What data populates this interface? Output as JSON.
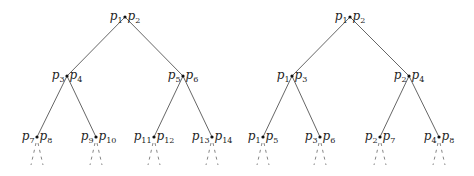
{
  "trees": [
    {
      "name": "left-tree",
      "nodes": [
        {
          "id": "root",
          "x": 125,
          "y": 17,
          "left": "1",
          "right": "2"
        },
        {
          "id": "l",
          "x": 67,
          "y": 76,
          "left": "3",
          "right": "4"
        },
        {
          "id": "r",
          "x": 183,
          "y": 76,
          "left": "5",
          "right": "6"
        },
        {
          "id": "ll",
          "x": 37,
          "y": 137,
          "left": "7",
          "right": "8"
        },
        {
          "id": "lr",
          "x": 96,
          "y": 137,
          "left": "9",
          "right": "10"
        },
        {
          "id": "rl",
          "x": 154,
          "y": 137,
          "left": "11",
          "right": "12"
        },
        {
          "id": "rr",
          "x": 212,
          "y": 137,
          "left": "13",
          "right": "14"
        }
      ]
    },
    {
      "name": "right-tree",
      "nodes": [
        {
          "id": "root",
          "x": 350,
          "y": 17,
          "left": "1",
          "right": "2"
        },
        {
          "id": "l",
          "x": 292,
          "y": 76,
          "left": "1",
          "right": "3"
        },
        {
          "id": "r",
          "x": 409,
          "y": 76,
          "left": "2",
          "right": "4"
        },
        {
          "id": "ll",
          "x": 263,
          "y": 137,
          "left": "1",
          "right": "5"
        },
        {
          "id": "lr",
          "x": 320,
          "y": 137,
          "left": "3",
          "right": "6"
        },
        {
          "id": "rl",
          "x": 380,
          "y": 137,
          "left": "2",
          "right": "7"
        },
        {
          "id": "rr",
          "x": 439,
          "y": 137,
          "left": "4",
          "right": "8"
        }
      ]
    }
  ],
  "label_symbol": "p"
}
